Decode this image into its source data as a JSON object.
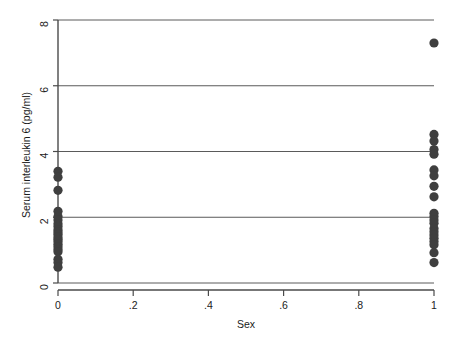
{
  "chart_data": {
    "type": "scatter",
    "title": "",
    "xlabel": "Sex",
    "ylabel": "Serum interleukin 6 (pg/ml)",
    "xlim": [
      0,
      1
    ],
    "ylim": [
      0,
      8
    ],
    "xticks": [
      0,
      0.2,
      0.4,
      0.6,
      0.8,
      1
    ],
    "xticklabels": [
      "0",
      ".2",
      ".4",
      ".6",
      ".8",
      "1"
    ],
    "yticks": [
      0,
      2,
      4,
      6,
      8
    ],
    "yticklabels": [
      "0",
      "2",
      "4",
      "6",
      "8"
    ],
    "grid": "horizontal",
    "gridlines_y": [
      0,
      2,
      4,
      6,
      8
    ],
    "legend": "none",
    "marker": "filled-circle",
    "marker_color": "#3f3f3f",
    "marker_size": 4.6,
    "series": [
      {
        "name": "Serum interleukin 6 by Sex",
        "points": [
          {
            "x": 0,
            "y": 3.4
          },
          {
            "x": 0,
            "y": 3.22
          },
          {
            "x": 0,
            "y": 2.82
          },
          {
            "x": 0,
            "y": 2.18
          },
          {
            "x": 0,
            "y": 2.02
          },
          {
            "x": 0,
            "y": 1.92
          },
          {
            "x": 0,
            "y": 1.8
          },
          {
            "x": 0,
            "y": 1.72
          },
          {
            "x": 0,
            "y": 1.62
          },
          {
            "x": 0,
            "y": 1.55
          },
          {
            "x": 0,
            "y": 1.48
          },
          {
            "x": 0,
            "y": 1.4
          },
          {
            "x": 0,
            "y": 1.33
          },
          {
            "x": 0,
            "y": 1.26
          },
          {
            "x": 0,
            "y": 1.18
          },
          {
            "x": 0,
            "y": 1.1
          },
          {
            "x": 0,
            "y": 1.02
          },
          {
            "x": 0,
            "y": 0.95
          },
          {
            "x": 0,
            "y": 0.72
          },
          {
            "x": 0,
            "y": 0.62
          },
          {
            "x": 0,
            "y": 0.48
          },
          {
            "x": 1,
            "y": 7.3
          },
          {
            "x": 1,
            "y": 4.52
          },
          {
            "x": 1,
            "y": 4.32
          },
          {
            "x": 1,
            "y": 4.06
          },
          {
            "x": 1,
            "y": 3.92
          },
          {
            "x": 1,
            "y": 3.44
          },
          {
            "x": 1,
            "y": 3.26
          },
          {
            "x": 1,
            "y": 2.94
          },
          {
            "x": 1,
            "y": 2.62
          },
          {
            "x": 1,
            "y": 2.12
          },
          {
            "x": 1,
            "y": 2.02
          },
          {
            "x": 1,
            "y": 1.92
          },
          {
            "x": 1,
            "y": 1.82
          },
          {
            "x": 1,
            "y": 1.66
          },
          {
            "x": 1,
            "y": 1.56
          },
          {
            "x": 1,
            "y": 1.46
          },
          {
            "x": 1,
            "y": 1.36
          },
          {
            "x": 1,
            "y": 1.26
          },
          {
            "x": 1,
            "y": 1.16
          },
          {
            "x": 1,
            "y": 0.92
          },
          {
            "x": 1,
            "y": 0.62
          }
        ]
      }
    ]
  },
  "colors": {
    "marker": "#3f3f3f",
    "axis": "#4a4a4a",
    "grid": "#5a5a5a",
    "text": "#1b1b1b",
    "background": "#ffffff"
  }
}
